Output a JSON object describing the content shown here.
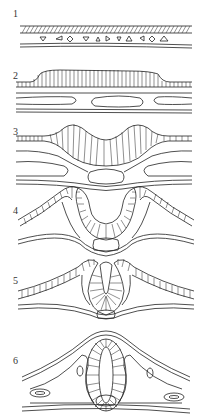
{
  "diagram": {
    "type": "neurulation-stages",
    "stages": [
      {
        "number": "1",
        "label": "1",
        "description": "flat neural plate over scattered mesoderm cells"
      },
      {
        "number": "2",
        "label": "2",
        "description": "thickened neural plate with notochord below"
      },
      {
        "number": "3",
        "label": "3",
        "description": "neural folds rising, neural groove forming"
      },
      {
        "number": "4",
        "label": "4",
        "description": "deep neural groove with elevated folds"
      },
      {
        "number": "5",
        "label": "5",
        "description": "neural folds meeting, tube closing"
      },
      {
        "number": "6",
        "label": "6",
        "description": "closed neural tube beneath ectoderm with somites"
      }
    ]
  },
  "colors": {
    "line": "#222222",
    "background": "#ffffff"
  }
}
